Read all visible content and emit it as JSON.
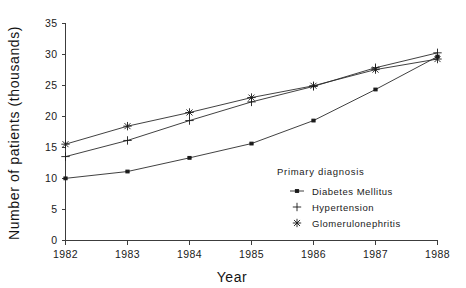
{
  "chart_data": {
    "type": "line",
    "title": "",
    "xlabel": "Year",
    "ylabel": "Number of patients (thousands)",
    "x": [
      1982,
      1983,
      1984,
      1985,
      1986,
      1987,
      1988
    ],
    "categories": [
      "1982",
      "1983",
      "1984",
      "1985",
      "1986",
      "1987",
      "1988"
    ],
    "xlim": [
      1982,
      1988
    ],
    "ylim": [
      0,
      35
    ],
    "yticks": [
      0,
      5,
      10,
      15,
      20,
      25,
      30,
      35
    ],
    "ytick_labels": [
      "0",
      "5",
      "10",
      "15",
      "20",
      "25",
      "30",
      "35"
    ],
    "xticks": [
      1982,
      1983,
      1984,
      1985,
      1986,
      1987,
      1988
    ],
    "xtick_labels": [
      "1982",
      "1983",
      "1984",
      "1985",
      "1986",
      "1987",
      "1988"
    ],
    "grid": false,
    "legend_position": "inside-lower-right",
    "legend_title": "Primary diagnosis",
    "series": [
      {
        "name": "Diabetes Mellitus",
        "marker": "dot",
        "values": [
          10.0,
          11.1,
          13.3,
          15.6,
          19.3,
          24.3,
          29.6
        ]
      },
      {
        "name": "Hypertension",
        "marker": "plus",
        "values": [
          13.5,
          16.1,
          19.3,
          22.3,
          24.8,
          27.8,
          30.2
        ]
      },
      {
        "name": "Glomerulonephritis",
        "marker": "asterisk",
        "values": [
          15.5,
          18.4,
          20.6,
          23.0,
          24.9,
          27.5,
          29.2
        ]
      }
    ]
  },
  "legend": {
    "title": "Primary diagnosis",
    "entries": [
      {
        "label": "Diabetes Mellitus",
        "marker": "dot-icon"
      },
      {
        "label": "Hypertension",
        "marker": "plus-icon"
      },
      {
        "label": "Glomerulonephritis",
        "marker": "asterisk-icon"
      }
    ]
  },
  "axes": {
    "x_title": "Year",
    "y_title": "Number of patients (thousands)"
  },
  "colors": {
    "line": "#2b2b2b",
    "axis": "#3c3c3c",
    "text": "#1a1a1a",
    "background": "#ffffff"
  }
}
